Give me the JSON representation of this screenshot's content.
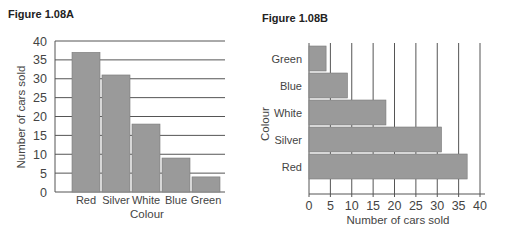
{
  "figures": [
    {
      "title": "Figure 1.08A"
    },
    {
      "title": "Figure 1.08B"
    }
  ],
  "colors": {
    "bar": "#9a9a9a",
    "bar_stroke": "#7a7a7a",
    "grid": "#555555",
    "axis": "#555555"
  },
  "chart_data": [
    {
      "type": "bar",
      "orientation": "vertical",
      "title": "Figure 1.08A",
      "categories": [
        "Red",
        "Silver",
        "White",
        "Blue",
        "Green"
      ],
      "values": [
        37,
        31,
        18,
        9,
        4
      ],
      "xlabel": "Colour",
      "ylabel": "Number of cars sold",
      "ylim": [
        0,
        40
      ],
      "yticks": [
        0,
        5,
        10,
        15,
        20,
        25,
        30,
        35,
        40
      ],
      "grid": "horizontal",
      "legend": "none"
    },
    {
      "type": "bar",
      "orientation": "horizontal",
      "title": "Figure 1.08B",
      "categories": [
        "Red",
        "Silver",
        "White",
        "Blue",
        "Green"
      ],
      "values": [
        37,
        31,
        18,
        9,
        4
      ],
      "xlabel": "Number of cars sold",
      "ylabel": "Colour",
      "xlim": [
        0,
        40
      ],
      "xticks": [
        0,
        5,
        10,
        15,
        20,
        25,
        30,
        35,
        40
      ],
      "grid": "vertical",
      "legend": "none"
    }
  ]
}
